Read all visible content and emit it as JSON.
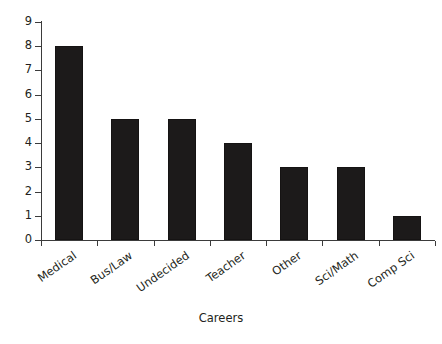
{
  "chart_data": {
    "type": "bar",
    "title": "",
    "subtitle": "",
    "xlabel": "Careers",
    "ylabel": "",
    "categories": [
      "Medical",
      "Bus/Law",
      "Undecided",
      "Teacher",
      "Other",
      "Sci/Math",
      "Comp Sci"
    ],
    "values": [
      8,
      5,
      5,
      4,
      3,
      3,
      1
    ],
    "ylim": [
      0,
      9
    ],
    "y_ticks": [
      "0",
      "1",
      "2",
      "3",
      "4",
      "5",
      "6",
      "7",
      "8",
      "9"
    ],
    "grid": false,
    "legend": false,
    "legend_position": "none",
    "bar_color": "#1c1a1a",
    "axis_color": "#3b3b3b",
    "background_color": "#ffffff",
    "text_color": "#231f20",
    "x_label_rotation": -35
  },
  "axes": {
    "y_tick_labels": [
      "9",
      "8",
      "7",
      "6",
      "5",
      "4",
      "3",
      "2",
      "1",
      "0"
    ],
    "x_axis_title": "Careers"
  }
}
